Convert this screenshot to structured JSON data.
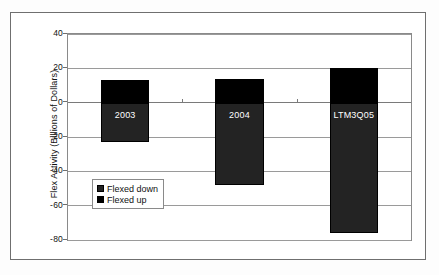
{
  "chart_data": {
    "type": "bar",
    "title": "",
    "xlabel": "",
    "ylabel": "Flex Activity (Billions of Dollars)",
    "ylim": [
      -80,
      40
    ],
    "ytick_labels": [
      "40",
      "20",
      "0",
      "-20",
      "-40",
      "-60",
      "-80"
    ],
    "ytick_values": [
      40,
      20,
      0,
      -20,
      -40,
      -60,
      -80
    ],
    "grid": true,
    "legend_position": "inside-lower-left",
    "categories": [
      "2003",
      "2004",
      "LTM3Q05"
    ],
    "series": [
      {
        "name": "Flexed down",
        "color": "#232323",
        "values": [
          -23,
          -48,
          -76
        ]
      },
      {
        "name": "Flexed up",
        "color": "#000000",
        "values": [
          13,
          14,
          20
        ]
      }
    ],
    "bar_labels": [
      "2003",
      "2004",
      "LTM3Q05"
    ]
  },
  "legend": {
    "items": [
      {
        "label": "Flexed down",
        "color": "#232323"
      },
      {
        "label": "Flexed up",
        "color": "#000000"
      }
    ]
  },
  "axis": {
    "y_title": "Flex Activity (Billions of Dollars)"
  }
}
